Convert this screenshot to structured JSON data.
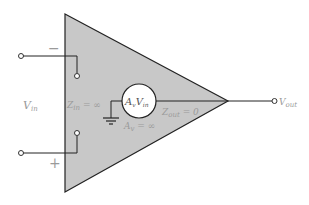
{
  "diagram": {
    "labels": {
      "minus_sign": "−",
      "plus_sign": "+",
      "vin": "V",
      "vin_sub": "in",
      "zin": "Z",
      "zin_sub": "in",
      "zin_value": " = ∞",
      "source_a": "A",
      "source_a_sub": "v",
      "source_v": "V",
      "source_v_sub": "in",
      "zout": "Z",
      "zout_sub": "out",
      "zout_value": " = 0",
      "av": "A",
      "av_sub": "v",
      "av_value": " = ∞",
      "vout": "V",
      "vout_sub": "out"
    },
    "colors": {
      "triangle_fill": "#c8c8c8",
      "line": "#222222",
      "label": "#9a9a9a",
      "source_fill": "#ffffff"
    }
  }
}
